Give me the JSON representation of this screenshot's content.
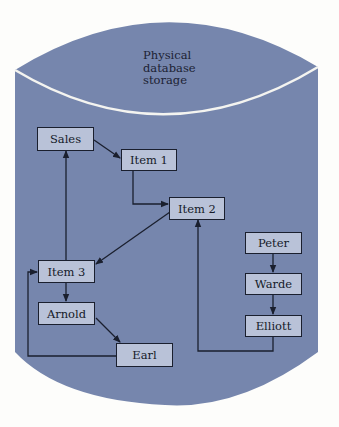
{
  "title_lines": [
    "Physical",
    "database",
    "storage"
  ],
  "nodes": {
    "sales": "Sales",
    "item1": "Item 1",
    "item2": "Item 2",
    "item3": "Item 3",
    "arnold": "Arnold",
    "earl": "Earl",
    "peter": "Peter",
    "warde": "Warde",
    "elliott": "Elliott"
  },
  "edges": [
    [
      "Sales",
      "Item 1"
    ],
    [
      "Item 1",
      "Item 2"
    ],
    [
      "Item 2",
      "Item 3"
    ],
    [
      "Item 3",
      "Sales"
    ],
    [
      "Item 3",
      "Arnold"
    ],
    [
      "Arnold",
      "Earl"
    ],
    [
      "Earl",
      "Item 3"
    ],
    [
      "Peter",
      "Warde"
    ],
    [
      "Warde",
      "Elliott"
    ],
    [
      "Elliott",
      "Item 2"
    ]
  ],
  "colors": {
    "cylinder": "#7686ad",
    "box_fill": "#b9c2d8",
    "line": "#1a1f2e"
  }
}
